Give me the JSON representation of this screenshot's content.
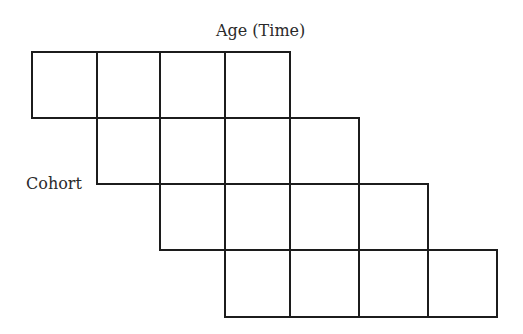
{
  "diagram": {
    "type": "cohort-age-lexis-grid",
    "x_axis_label": "Age (Time)",
    "y_axis_label": "Cohort",
    "line_color": "#1c1c1c",
    "background_color": "#ffffff",
    "columns_x": [
      32,
      97,
      160,
      225,
      290,
      359,
      428,
      497
    ],
    "rows_y": [
      52,
      118,
      184,
      250,
      317
    ],
    "rows": [
      {
        "cohort_index": 1,
        "start_col": 0,
        "cell_count": 4
      },
      {
        "cohort_index": 2,
        "start_col": 1,
        "cell_count": 4
      },
      {
        "cohort_index": 3,
        "start_col": 2,
        "cell_count": 4
      },
      {
        "cohort_index": 4,
        "start_col": 3,
        "cell_count": 4
      }
    ]
  }
}
